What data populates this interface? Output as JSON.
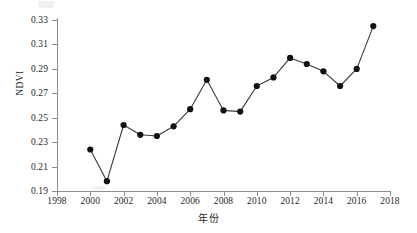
{
  "chart_data": {
    "type": "line",
    "title": "",
    "xlabel": "年份",
    "ylabel": "NDVI",
    "xlim": [
      1998,
      2018
    ],
    "ylim": [
      0.19,
      0.33
    ],
    "xticks": [
      1998,
      2000,
      2002,
      2004,
      2006,
      2008,
      2010,
      2012,
      2014,
      2016,
      2018
    ],
    "yticks": [
      0.19,
      0.21,
      0.23,
      0.25,
      0.27,
      0.29,
      0.31,
      0.33
    ],
    "ytick_labels": [
      "0.19",
      "0.21",
      "0.23",
      "0.25",
      "0.27",
      "0.29",
      "0.31",
      "0.33"
    ],
    "xtick_labels": [
      "1998",
      "2000",
      "2002",
      "2004",
      "2006",
      "2008",
      "2010",
      "2012",
      "2014",
      "2016",
      "2018"
    ],
    "grid": false,
    "legend": null,
    "marker": "filled-circle",
    "marker_color": "#111111",
    "line_color": "#3a3a3a",
    "x": [
      2000,
      2001,
      2002,
      2003,
      2004,
      2005,
      2006,
      2007,
      2008,
      2009,
      2010,
      2011,
      2012,
      2013,
      2014,
      2015,
      2016,
      2017
    ],
    "values": [
      0.224,
      0.198,
      0.244,
      0.236,
      0.235,
      0.243,
      0.257,
      0.281,
      0.256,
      0.255,
      0.276,
      0.283,
      0.299,
      0.294,
      0.288,
      0.276,
      0.29,
      0.325
    ],
    "series": [
      {
        "name": "NDVI",
        "values": [
          0.224,
          0.198,
          0.244,
          0.236,
          0.235,
          0.243,
          0.257,
          0.281,
          0.256,
          0.255,
          0.276,
          0.283,
          0.299,
          0.294,
          0.288,
          0.276,
          0.29,
          0.325
        ]
      }
    ]
  }
}
